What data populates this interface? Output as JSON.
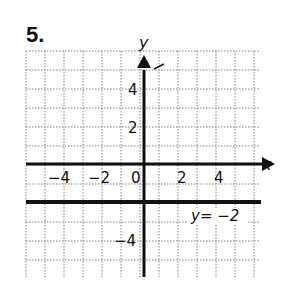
{
  "problem": {
    "number": "5."
  },
  "chart_data": {
    "type": "line",
    "title": "",
    "xlabel": "x",
    "ylabel": "y",
    "xlim": [
      -7,
      5
    ],
    "ylim": [
      -6,
      6
    ],
    "grid": true,
    "grid_step": 1,
    "x_ticks": [
      -4,
      -2,
      0,
      2,
      4
    ],
    "x_tick_labels": [
      "−4",
      "−2",
      "0",
      "2",
      "4"
    ],
    "y_ticks": [
      4,
      2,
      -4
    ],
    "y_tick_labels": [
      "4",
      "2",
      "−4"
    ],
    "series": [
      {
        "name": "y = −2",
        "equation": "y = -2",
        "x": [
          -7,
          6
        ],
        "values": [
          -2,
          -2
        ]
      }
    ],
    "annotations": [
      {
        "text": "y = −2",
        "x": 3.2,
        "y": -2.8
      }
    ]
  },
  "labels": {
    "x_axis": "x",
    "y_axis": "y",
    "line_label": "y= −2",
    "tick_x": [
      "−4",
      "−2",
      "0",
      "2",
      "4"
    ],
    "tick_y": [
      "4",
      "2",
      "−4"
    ]
  }
}
